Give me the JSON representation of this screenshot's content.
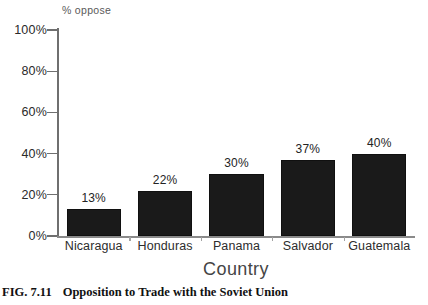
{
  "figure": {
    "caption_label": "FIG. 7.11",
    "caption_text": "Opposition to Trade with the Soviet Union"
  },
  "chart_data": {
    "type": "bar",
    "title": "",
    "xlabel": "Country",
    "ylabel": "% oppose",
    "categories": [
      "Nicaragua",
      "Honduras",
      "Panama",
      "Salvador",
      "Guatemala"
    ],
    "values": [
      13,
      22,
      30,
      37,
      40
    ],
    "value_labels": [
      "13%",
      "22%",
      "30%",
      "37%",
      "40%"
    ],
    "ylim": [
      0,
      100
    ],
    "yticks": [
      0,
      20,
      40,
      60,
      80,
      100
    ],
    "ytick_labels": [
      "0%",
      "20%",
      "40%",
      "60%",
      "80%",
      "100%"
    ],
    "grid": false,
    "legend": null,
    "bar_color": "#1a1a1a",
    "axis_color": "#6f6f6f"
  }
}
